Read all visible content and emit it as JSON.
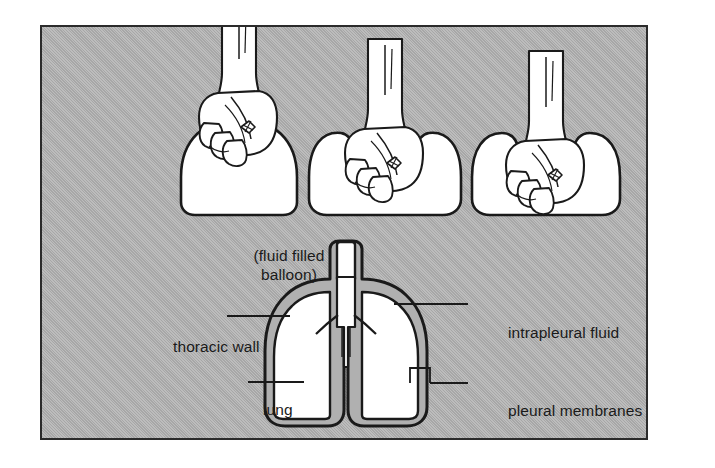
{
  "figure": {
    "panel_background_color": "#b0b0b0",
    "ink_color": "#1a1a1a",
    "structure_fill_color": "#ffffff",
    "fluid_gap_color": "#b0b0b0"
  },
  "top_row": {
    "caption": "(fluid filled\nballoon)",
    "caption_line1": "(fluid filled",
    "caption_line2": "balloon)",
    "panels": [
      {
        "name": "fist-above-balloon",
        "description": "fist held above an undeformed fluid filled balloon"
      },
      {
        "name": "fist-pressing-balloon",
        "description": "fist pressed partway into the balloon"
      },
      {
        "name": "fist-deep-in-balloon",
        "description": "fist pushed deeply into the balloon"
      }
    ]
  },
  "lung_diagram": {
    "labels": {
      "thoracic_wall": "thoracic wall",
      "lung": "lung",
      "intrapleural_fluid": "intrapleural fluid",
      "pleural_membranes": "pleural membranes"
    },
    "parts": [
      "trachea",
      "left lung",
      "right lung",
      "thoracic wall",
      "intrapleural fluid",
      "pleural membranes"
    ]
  }
}
